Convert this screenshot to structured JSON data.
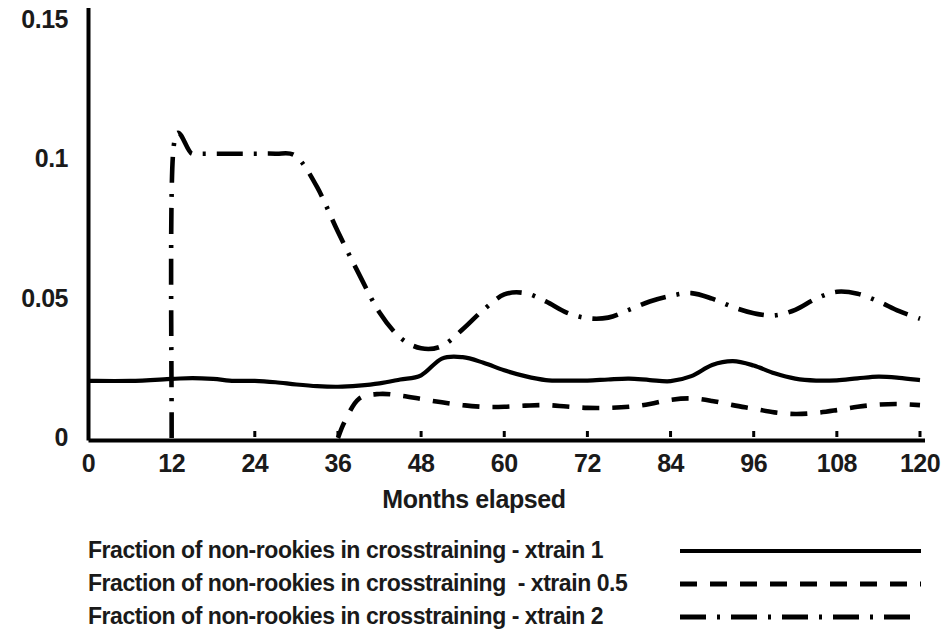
{
  "chart_data": {
    "type": "line",
    "title": "",
    "xlabel": "Months elapsed",
    "ylabel": "",
    "xlim": [
      0,
      120
    ],
    "ylim": [
      0,
      0.155
    ],
    "grid": false,
    "legend_position": "below",
    "x_ticks": [
      "0",
      "12",
      "24",
      "36",
      "48",
      "60",
      "72",
      "84",
      "96",
      "108",
      "120"
    ],
    "y_ticks": [
      "0",
      "0.05",
      "0.1",
      "0.15"
    ],
    "x_tick_values": [
      0,
      12,
      24,
      36,
      48,
      60,
      72,
      84,
      96,
      108,
      120
    ],
    "y_tick_values": [
      0,
      0.05,
      0.1,
      0.15
    ],
    "series": [
      {
        "name": "Fraction of non-rookies in crosstraining - xtrain 1",
        "style": "solid",
        "color": "#000000",
        "x": [
          0,
          6,
          12,
          15,
          18,
          21,
          24,
          27,
          30,
          33,
          36,
          39,
          42,
          45,
          48,
          51,
          54,
          57,
          60,
          63,
          66,
          69,
          72,
          75,
          78,
          81,
          84,
          87,
          90,
          93,
          96,
          99,
          102,
          105,
          108,
          111,
          114,
          117,
          120
        ],
        "y": [
          0.0205,
          0.0205,
          0.0212,
          0.0215,
          0.0212,
          0.0205,
          0.0205,
          0.02,
          0.0192,
          0.0186,
          0.0184,
          0.0188,
          0.0196,
          0.021,
          0.0225,
          0.0285,
          0.029,
          0.027,
          0.0243,
          0.0222,
          0.0208,
          0.0206,
          0.0206,
          0.021,
          0.0213,
          0.0208,
          0.0204,
          0.0222,
          0.0262,
          0.0276,
          0.026,
          0.0232,
          0.0213,
          0.0206,
          0.0207,
          0.0214,
          0.022,
          0.0216,
          0.0208
        ]
      },
      {
        "name": "Fraction of non-rookies in crosstraining  - xtrain 0.5",
        "style": "dashed",
        "color": "#000000",
        "x": [
          36,
          37,
          39,
          42,
          45,
          48,
          51,
          54,
          57,
          60,
          63,
          66,
          69,
          72,
          75,
          78,
          81,
          84,
          87,
          90,
          93,
          96,
          99,
          102,
          105,
          108,
          111,
          114,
          117,
          120
        ],
        "y": [
          0.0,
          0.006,
          0.014,
          0.0158,
          0.0152,
          0.014,
          0.0128,
          0.0118,
          0.0112,
          0.0112,
          0.0116,
          0.0118,
          0.0113,
          0.0108,
          0.0108,
          0.0112,
          0.0122,
          0.0137,
          0.0142,
          0.0133,
          0.0118,
          0.0105,
          0.0092,
          0.0086,
          0.009,
          0.01,
          0.0112,
          0.012,
          0.0122,
          0.0118
        ]
      },
      {
        "name": "Fraction of non-rookies in crosstraining - xtrain 2",
        "style": "dashdot",
        "color": "#000000",
        "x": [
          12,
          12.2,
          15,
          18,
          21,
          24,
          27,
          30,
          33,
          36,
          39,
          42,
          45,
          48,
          51,
          54,
          57,
          60,
          63,
          66,
          69,
          72,
          75,
          78,
          81,
          84,
          87,
          90,
          93,
          96,
          99,
          102,
          105,
          108,
          111,
          114,
          117,
          120
        ],
        "y": [
          0.0,
          0.102,
          0.102,
          0.102,
          0.102,
          0.102,
          0.102,
          0.101,
          0.09,
          0.074,
          0.059,
          0.045,
          0.036,
          0.0322,
          0.033,
          0.039,
          0.046,
          0.0515,
          0.052,
          0.049,
          0.045,
          0.043,
          0.0432,
          0.046,
          0.049,
          0.051,
          0.052,
          0.05,
          0.047,
          0.0448,
          0.044,
          0.046,
          0.05,
          0.0525,
          0.0518,
          0.049,
          0.0455,
          0.0428
        ]
      }
    ]
  },
  "axes": {
    "xaxis_title": "Months elapsed"
  },
  "legend": {
    "items": [
      {
        "label": "Fraction of non-rookies in crosstraining - xtrain 1",
        "style": "solid"
      },
      {
        "label": "Fraction of non-rookies in crosstraining  - xtrain 0.5",
        "style": "dashed"
      },
      {
        "label": "Fraction of non-rookies in crosstraining - xtrain 2",
        "style": "dashdot"
      }
    ]
  },
  "colors": {
    "line": "#000000",
    "axis": "#000000",
    "text": "#1a1a1a",
    "background": "#ffffff"
  }
}
